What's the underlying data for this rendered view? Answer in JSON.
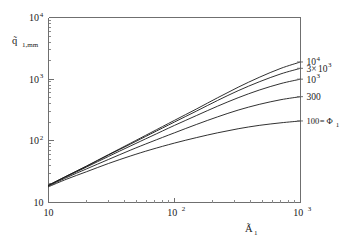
{
  "chart_data": {
    "type": "line",
    "title": "",
    "subtitle": "",
    "xlabel": "Ã₁",
    "xlabel_base": "Ã",
    "xlabel_sub": "1",
    "ylabel": "q̃₁,mm",
    "ylabel_base": "q̃",
    "ylabel_sub": "1,mm",
    "xscale": "log",
    "yscale": "log",
    "xlim": [
      10,
      1000
    ],
    "ylim": [
      10,
      10000
    ],
    "grid": false,
    "legend_position": "right-outside",
    "legend_note": "100 = Φ₁",
    "xticks": [
      {
        "value": 10,
        "label": "10",
        "mantissa": "10",
        "exponent": ""
      },
      {
        "value": 100,
        "label": "10²",
        "mantissa": "10",
        "exponent": "2"
      },
      {
        "value": 1000,
        "label": "10³",
        "mantissa": "10",
        "exponent": "3"
      }
    ],
    "yticks": [
      {
        "value": 10,
        "label": "10",
        "mantissa": "10",
        "exponent": ""
      },
      {
        "value": 100,
        "label": "10²",
        "mantissa": "10",
        "exponent": "2"
      },
      {
        "value": 1000,
        "label": "10³",
        "mantissa": "10",
        "exponent": "3"
      },
      {
        "value": 10000,
        "label": "10⁴",
        "mantissa": "10",
        "exponent": "4"
      }
    ],
    "series": [
      {
        "name": "10⁴",
        "label_mantissa": "10",
        "label_exponent": "4",
        "label_prefix": "",
        "phi1": 10000,
        "x": [
          10,
          14,
          20,
          30,
          45,
          65,
          100,
          150,
          220,
          320,
          470,
          700,
          1000
        ],
        "y": [
          19,
          27,
          39,
          60,
          92,
          136,
          215,
          330,
          500,
          740,
          1070,
          1500,
          1900
        ]
      },
      {
        "name": "3×10³",
        "label_mantissa": "10",
        "label_exponent": "3",
        "label_prefix": "3×",
        "phi1": 3000,
        "x": [
          10,
          14,
          20,
          30,
          45,
          65,
          100,
          150,
          220,
          320,
          470,
          700,
          1000
        ],
        "y": [
          19,
          27,
          38.5,
          59,
          89,
          130,
          202,
          305,
          452,
          650,
          905,
          1220,
          1500
        ]
      },
      {
        "name": "10³",
        "label_mantissa": "10",
        "label_exponent": "3",
        "label_prefix": "",
        "phi1": 1000,
        "x": [
          10,
          14,
          20,
          30,
          45,
          65,
          100,
          150,
          220,
          320,
          470,
          700,
          1000
        ],
        "y": [
          19,
          26.5,
          37.5,
          56,
          83,
          118,
          178,
          258,
          365,
          500,
          665,
          850,
          1000
        ]
      },
      {
        "name": "300",
        "label_mantissa": "300",
        "label_exponent": "",
        "label_prefix": "",
        "phi1": 300,
        "x": [
          10,
          14,
          20,
          30,
          45,
          65,
          100,
          150,
          220,
          320,
          470,
          700,
          1000
        ],
        "y": [
          18.5,
          25.5,
          35,
          50,
          71,
          96,
          135,
          185,
          245,
          315,
          390,
          465,
          520
        ]
      },
      {
        "name": "100 = Φ₁",
        "label_mantissa": "100",
        "label_exponent": "",
        "label_prefix": "",
        "label_suffix": " = Φ",
        "label_suffix_sub": "1",
        "phi1": 100,
        "x": [
          10,
          14,
          20,
          30,
          45,
          65,
          100,
          150,
          220,
          320,
          470,
          700,
          1000
        ],
        "y": [
          18,
          24,
          31.5,
          43,
          57,
          72,
          92,
          113,
          135,
          157,
          178,
          196,
          210
        ]
      }
    ]
  }
}
